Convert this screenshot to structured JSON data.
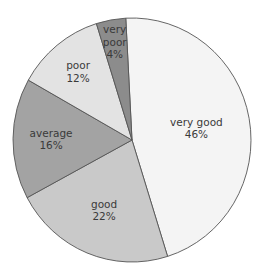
{
  "chart_data": {
    "type": "pie",
    "title": "",
    "categories": [
      "very good",
      "good",
      "average",
      "poor",
      "very poor"
    ],
    "values": [
      46,
      22,
      16,
      12,
      4
    ],
    "labels": [
      "46%",
      "22%",
      "16%",
      "12%",
      "4%"
    ],
    "colors": [
      "#f4f4f4",
      "#c9c9c9",
      "#a3a3a3",
      "#e3e3e3",
      "#8c8c8c"
    ],
    "start_angle_deg": -3,
    "direction": "clockwise",
    "legend": "none"
  },
  "slices": [
    {
      "name": "very good",
      "lines": [
        "very good"
      ],
      "pct": "46%"
    },
    {
      "name": "good",
      "lines": [
        "good"
      ],
      "pct": "22%"
    },
    {
      "name": "average",
      "lines": [
        "average"
      ],
      "pct": "16%"
    },
    {
      "name": "poor",
      "lines": [
        "poor"
      ],
      "pct": "12%"
    },
    {
      "name": "very poor",
      "lines": [
        "very",
        "poor"
      ],
      "pct": "4%"
    }
  ]
}
